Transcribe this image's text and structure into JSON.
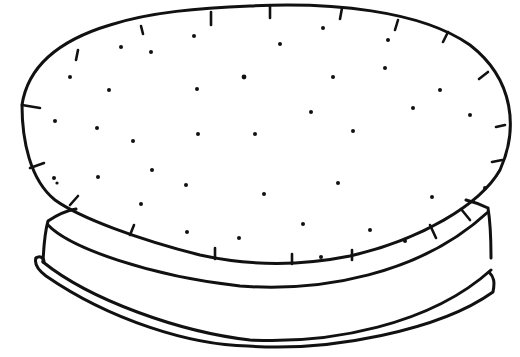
{
  "illustration": {
    "subject": "hand-drawn pie crust disc tilted above a round baking dish",
    "style": "black ink line drawing on white",
    "colors": {
      "ink": "#111111",
      "background": "#ffffff"
    },
    "parts": [
      "crust-disc",
      "fork-prick-dots",
      "crimp-ticks",
      "pie-dish"
    ]
  }
}
